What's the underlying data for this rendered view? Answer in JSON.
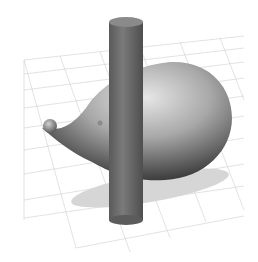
{
  "scene": {
    "description": "3D render of a hedgehog-like blob shape pierced by a vertical cylinder on a perspective grid floor",
    "colors": {
      "background": "#ffffff",
      "grid": "#c8c8c8",
      "cylinder": "#6e6e6e",
      "body_light": "#d8d8d8",
      "body_dark": "#3c3c3c",
      "shadow": "#d4d4d4"
    },
    "grid_labels": [
      "",
      "",
      ""
    ]
  }
}
